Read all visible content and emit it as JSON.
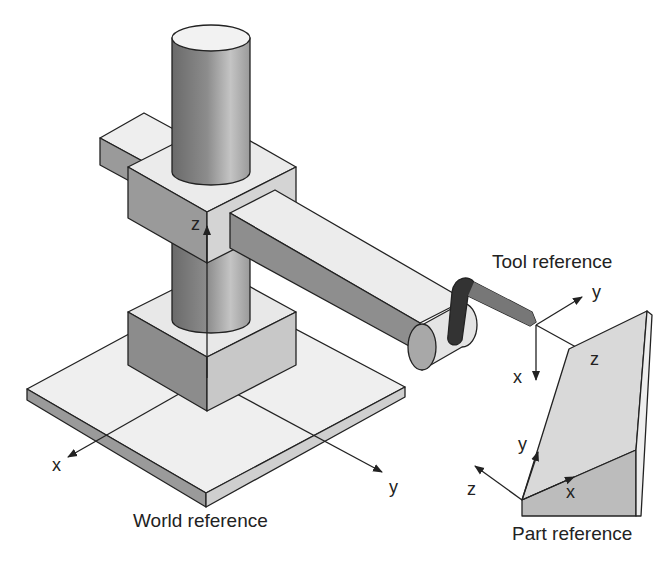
{
  "diagram": {
    "colors": {
      "outline": "#222222",
      "light_face": "#ececec",
      "mid_face": "#b8b8b8",
      "dark_face": "#8a8a8a",
      "gripper": "#333333",
      "tool_bar": "#777777"
    },
    "frames": {
      "world": {
        "title": "World reference",
        "axes": {
          "x": "x",
          "y": "y",
          "z": "z"
        }
      },
      "tool": {
        "title": "Tool reference",
        "axes": {
          "x": "x",
          "y": "y",
          "z": "z"
        }
      },
      "part": {
        "title": "Part reference",
        "axes": {
          "x": "x",
          "y": "y",
          "z": "z"
        }
      }
    }
  }
}
